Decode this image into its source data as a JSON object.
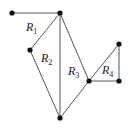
{
  "diagram": {
    "type": "planar-graph",
    "vertices": [
      {
        "id": "A",
        "x": 12,
        "y": 13
      },
      {
        "id": "B",
        "x": 60,
        "y": 13
      },
      {
        "id": "C",
        "x": 30,
        "y": 50
      },
      {
        "id": "D",
        "x": 89,
        "y": 81
      },
      {
        "id": "E",
        "x": 119,
        "y": 44
      },
      {
        "id": "F",
        "x": 119,
        "y": 81
      },
      {
        "id": "G",
        "x": 60,
        "y": 118
      }
    ],
    "edges": [
      [
        "A",
        "B"
      ],
      [
        "B",
        "C"
      ],
      [
        "C",
        "G"
      ],
      [
        "B",
        "G"
      ],
      [
        "B",
        "D"
      ],
      [
        "D",
        "G"
      ],
      [
        "D",
        "E"
      ],
      [
        "E",
        "F"
      ],
      [
        "D",
        "F"
      ]
    ],
    "regions": [
      {
        "main": "R",
        "sub": "1",
        "x": 26,
        "y": 31
      },
      {
        "main": "R",
        "sub": "2",
        "x": 41,
        "y": 62
      },
      {
        "main": "R",
        "sub": "3",
        "x": 68,
        "y": 75
      },
      {
        "main": "R",
        "sub": "4",
        "x": 102,
        "y": 74
      }
    ]
  }
}
